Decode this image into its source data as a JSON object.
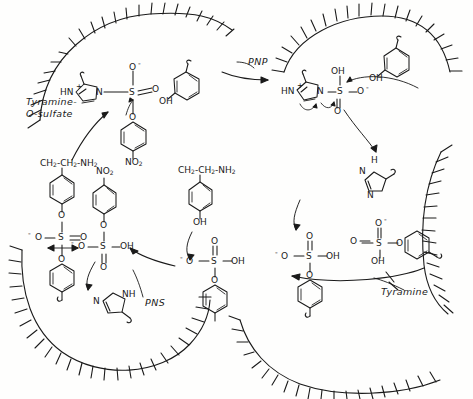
{
  "figure": {
    "type": "reaction-scheme",
    "style": "hand-drawn line art, black ink on white"
  },
  "reaction_labels": [
    {
      "id": "pnp",
      "text": "PNP",
      "x": 248,
      "y": 62
    },
    {
      "id": "tyramine",
      "text": "Tyramine",
      "x": 381,
      "y": 292
    },
    {
      "id": "pns",
      "text": "PNS",
      "x": 145,
      "y": 303
    }
  ],
  "product_label": {
    "line1": "Tyramine-",
    "line2": "O-sulfate",
    "x": 26,
    "y": 100
  },
  "structures": {
    "top_left_complex": {
      "name": "imidazolium-N-sulfo / 4-nitrophenyl sulfate intermediate",
      "ring_labels": [
        "HN",
        "N"
      ],
      "charges": [
        "+",
        "-"
      ],
      "sulfur": "S",
      "oxygens": [
        "O",
        "O",
        "O"
      ],
      "aryl_substituent": "NO",
      "aryl_sub_index": "2"
    },
    "top_left_phenol": {
      "name": "p-cresol / tyramine phenol ring",
      "label": "OH"
    },
    "top_right_complex": {
      "name": "imidazolium sulfate adduct after PNP release",
      "ring_labels": [
        "HN",
        "N"
      ],
      "charge": "+",
      "sulfur": "S",
      "oxygens": [
        "OH",
        "O",
        "O"
      ],
      "anion": "-"
    },
    "top_right_phenol": {
      "name": "phenol ring donating proton",
      "label": "OH"
    },
    "right_imidazole": {
      "name": "neutral imidazole (right)",
      "labels": [
        "H",
        "N",
        "N"
      ]
    },
    "right_sulfate": {
      "name": "aryl sulfate ester (right)",
      "labels": [
        "O",
        "S",
        "O",
        "OH"
      ],
      "charge": "-"
    },
    "left_tyramine_sulfate": {
      "name": "tyramine-O-sulfate",
      "chain": "CH2-CH2-NH2",
      "chain_parts": [
        "CH",
        "2",
        "-CH",
        "2",
        "-NH",
        "2"
      ],
      "ester_o": "O",
      "sulfonate": [
        "O",
        "S",
        "O",
        "O"
      ],
      "charge": "-"
    },
    "left_nitrophenyl_sulfate": {
      "name": "4-nitrophenyl sulfate (PNS)",
      "nitro": "NO",
      "nitro_index": "2",
      "ester_o": "O",
      "sulfate": [
        "O",
        "S",
        "OH",
        "O"
      ],
      "charge": "-"
    },
    "center_tyramine": {
      "name": "tyramine",
      "chain_parts": [
        "CH",
        "2",
        "-CH",
        "2",
        "-NH",
        "2"
      ],
      "phenol": "OH"
    },
    "center_sulfate": {
      "name": "sulfate / bisulfate leaving group",
      "labels": [
        "O",
        "S",
        "OH",
        "O"
      ],
      "charge": "-"
    },
    "center_imidazole": {
      "name": "imidazole (bottom center)",
      "labels": [
        "N",
        "NH"
      ]
    },
    "bottom_left_phenyl": {
      "name": "phenyl ring anchored to membrane (bottom left)"
    },
    "bottom_right_phenyl_sulfate": {
      "name": "aryl sulfate anchored to membrane (bottom right)",
      "labels": [
        "O",
        "S",
        "OH",
        "O"
      ],
      "charge": "-"
    }
  },
  "membranes": [
    {
      "id": "top-left-membrane",
      "description": "hatched membrane arc, upper left cell surface"
    },
    {
      "id": "top-right-membrane",
      "description": "hatched membrane arc, upper right cell surface"
    },
    {
      "id": "right-membrane",
      "description": "hatched membrane arc, right side"
    },
    {
      "id": "bottom-left-membrane",
      "description": "hatched membrane arc, lower left cell surface"
    },
    {
      "id": "bottom-right-membrane",
      "description": "hatched membrane arc, lower right cell surface"
    }
  ],
  "colors": {
    "ink": "#1a1a1a",
    "background": "#fefefd"
  }
}
